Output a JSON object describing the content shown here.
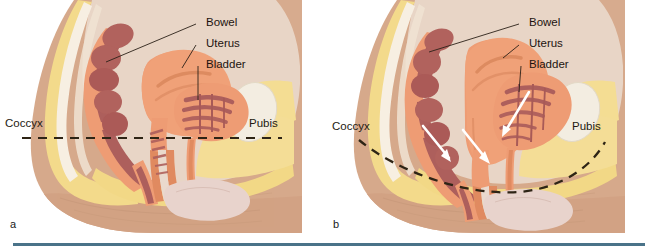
{
  "figure": {
    "caption_rule_color": "#4a7389",
    "background": "#ffffff",
    "panels": [
      {
        "id": "a",
        "letter": "a",
        "description": "Normal pelvic floor support",
        "levator_line_style": "straight-dashed",
        "labels": {
          "bowel": "Bowel",
          "uterus": "Uterus",
          "bladder": "Bladder",
          "coccyx": "Coccyx",
          "pubis": "Pubis"
        },
        "arrows": []
      },
      {
        "id": "b",
        "letter": "b",
        "description": "Prolapse with descent of pelvic organs",
        "levator_line_style": "sagging-dashed",
        "labels": {
          "bowel": "Bowel",
          "uterus": "Uterus",
          "bladder": "Bladder",
          "coccyx": "Coccyx",
          "pubis": "Pubis"
        },
        "arrows": [
          {
            "name": "bowel-descent-arrow",
            "direction": "down"
          },
          {
            "name": "uterus-descent-arrow",
            "direction": "down"
          },
          {
            "name": "bladder-descent-arrow",
            "direction": "down"
          }
        ]
      }
    ]
  },
  "colors": {
    "skin": "#d6a98b",
    "skin_shadow": "#c99b7c",
    "skin_light": "#e2bb9f",
    "fat_yellow": "#f3da8b",
    "fat_yellow_light": "#f7e6ad",
    "bone_cream": "#f0ebe0",
    "muscle_salmon": "#ee9c74",
    "muscle_salmon_dark": "#e08a60",
    "bowel_dark": "#ad5f5c",
    "bowel_mid": "#bd6f68",
    "cavity_pale": "#e8d3c4",
    "vagina_pink": "#e8cfc8",
    "interior_pale": "#ead9cd",
    "line_dark": "#2e2415",
    "arrow_white": "#ffffff"
  }
}
